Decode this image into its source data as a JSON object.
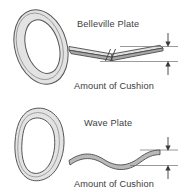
{
  "figure": {
    "background_color": "#ffffff",
    "line_color": "#4a4a4a",
    "fill_color": "#e0e0e0",
    "edge_shade_color": "#a8a8a8",
    "text_color": "#3d3d3d",
    "panels": [
      {
        "id": "belleville",
        "plate_label": "Belleville Plate",
        "cushion_label": "Amount of Cushion",
        "ring_name": "belleville-washer-ring",
        "profile_name": "belleville-plate-profile",
        "profile_shape": "shallow-cone-section-with-break",
        "has_break_symbol": true,
        "dimension_name": "cushion-dimension-belleville"
      },
      {
        "id": "wave",
        "plate_label": "Wave Plate",
        "cushion_label": "Amount of Cushion",
        "ring_name": "wave-washer-ring",
        "profile_name": "wave-plate-profile",
        "profile_shape": "sinusoidal-wave-section",
        "has_break_symbol": false,
        "dimension_name": "cushion-dimension-wave"
      }
    ]
  }
}
